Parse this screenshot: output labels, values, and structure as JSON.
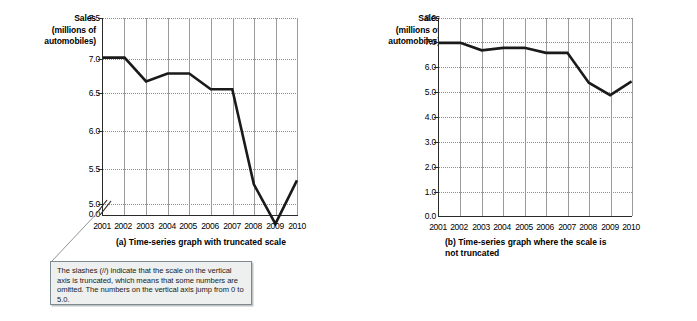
{
  "figure": {
    "panel_a": {
      "id": "a",
      "y_axis_title_line1": "Sales",
      "y_axis_title_line2": "(millions of",
      "y_axis_title_line3": "automobiles)",
      "y_ticks": [
        "7.5",
        "7.0",
        "6.5",
        "6.0",
        "5.5",
        "5.0",
        "0.0"
      ],
      "truncation_marker": "//",
      "caption": "(a) Time-series graph with truncated scale"
    },
    "panel_b": {
      "id": "b",
      "y_axis_title_line1": "Sales",
      "y_axis_title_line2": "(millions of",
      "y_axis_title_line3": "automobiles)",
      "y_ticks": [
        "8.0",
        "7.0",
        "6.0",
        "5.0",
        "4.0",
        "3.0",
        "2.0",
        "1.0",
        "0.0"
      ],
      "caption_line1": "(b) Time-series graph where the scale is",
      "caption_line2": "not truncated"
    },
    "callout": {
      "text": "The slashes (//) indicate that the scale on the vertical axis is truncated, which means that some numbers are omitted.  The numbers on the vertical axis jump from 0 to 5.0."
    }
  },
  "chart_data": [
    {
      "type": "line",
      "title": "(a) Time-series graph with truncated scale",
      "xlabel": "",
      "ylabel": "Sales (millions of automobiles)",
      "categories": [
        "2001",
        "2002",
        "2003",
        "2004",
        "2005",
        "2006",
        "2007",
        "2008",
        "2009",
        "2010"
      ],
      "values": [
        7.0,
        7.0,
        6.7,
        6.8,
        6.8,
        6.6,
        6.6,
        5.4,
        4.9,
        5.45
      ],
      "ylim": [
        5.0,
        7.5
      ],
      "y_ticks": [
        5.0,
        5.5,
        6.0,
        6.5,
        7.0,
        7.5
      ],
      "axis_truncated": true,
      "truncated_from": 0.0,
      "truncated_to": 5.0,
      "grid": true,
      "legend": "none",
      "line_color": "#1a1a1a"
    },
    {
      "type": "line",
      "title": "(b) Time-series graph where the scale is not truncated",
      "xlabel": "",
      "ylabel": "Sales (millions of automobiles)",
      "categories": [
        "2001",
        "2002",
        "2003",
        "2004",
        "2005",
        "2006",
        "2007",
        "2008",
        "2009",
        "2010"
      ],
      "values": [
        7.0,
        7.0,
        6.7,
        6.8,
        6.8,
        6.6,
        6.6,
        5.4,
        4.9,
        5.45
      ],
      "ylim": [
        0.0,
        8.0
      ],
      "y_ticks": [
        0.0,
        1.0,
        2.0,
        3.0,
        4.0,
        5.0,
        6.0,
        7.0,
        8.0
      ],
      "axis_truncated": false,
      "grid": true,
      "legend": "none",
      "line_color": "#1a1a1a"
    }
  ]
}
